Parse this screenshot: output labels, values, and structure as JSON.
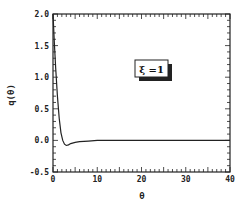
{
  "chart_data": {
    "type": "line",
    "title": "",
    "xlabel": "θ",
    "ylabel": "q(θ)",
    "xlim": [
      0,
      40
    ],
    "ylim": [
      -0.5,
      2.0
    ],
    "xticks": [
      "0",
      "10",
      "20",
      "30",
      "40"
    ],
    "yticks": [
      "2.0",
      "1.5",
      "1.0",
      "0.5",
      "0.0",
      "-0.5"
    ],
    "grid": false,
    "annotation": "ξ =1",
    "series": [
      {
        "name": "ξ =1",
        "x": [
          0,
          0.3,
          0.6,
          1.0,
          1.4,
          1.8,
          2.2,
          2.6,
          3.0,
          3.5,
          4.0,
          5.0,
          6.0,
          8.0,
          10.0,
          15.0,
          20.0,
          30.0,
          40.0
        ],
        "y": [
          2.0,
          1.55,
          1.15,
          0.7,
          0.35,
          0.12,
          0.0,
          -0.06,
          -0.08,
          -0.07,
          -0.05,
          -0.03,
          -0.02,
          -0.01,
          0.0,
          0.0,
          0.0,
          0.0,
          0.0
        ]
      }
    ]
  }
}
